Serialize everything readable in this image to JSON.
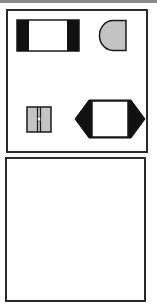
{
  "colors": {
    "stroke": "#1a1a1a",
    "black_fill": "#111111",
    "gray_fill": "#c4c4c4",
    "white_fill": "#ffffff",
    "panel_border": "#2a2a2a",
    "top_rule": "#8a8a8a"
  },
  "panels": [
    {
      "id": "top",
      "shapes": [
        {
          "type": "rect-with-black-ends",
          "name": "Black-ended rectangle"
        },
        {
          "type": "d-shape",
          "name": "Gray D-shape"
        },
        {
          "type": "split-square",
          "name": "Gray split square"
        },
        {
          "type": "hexagon-with-inner-rect",
          "name": "Black hexagon with white rectangle"
        }
      ]
    },
    {
      "id": "bottom",
      "shapes": []
    }
  ]
}
